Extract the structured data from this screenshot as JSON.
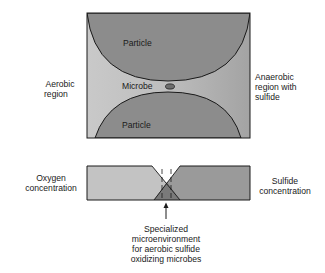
{
  "diagram": {
    "top_panel": {
      "particle_top_label": "Particle",
      "particle_bottom_label": "Particle",
      "microbe_label": "Microbe",
      "left_label_line1": "Aerobic",
      "left_label_line2": "region",
      "right_label_line1": "Anaerobic",
      "right_label_line2": "region with",
      "right_label_line3": "sulfide"
    },
    "bottom_panel": {
      "left_label_line1": "Oxygen",
      "left_label_line2": "concentration",
      "right_label_line1": "Sulfide",
      "right_label_line2": "concentration",
      "caption_line1": "Specialized",
      "caption_line2": "microenvironment",
      "caption_line3": "for aerobic sulfide",
      "caption_line4": "oxidizing microbes"
    },
    "colors": {
      "particle": "#8c8c8c",
      "aerobic_fill": "#c6c6c6",
      "anaerobic_fill": "#a2a2a2",
      "oxygen_fill": "#c3c3c3",
      "sulfide_fill": "#9a9a9a",
      "overlap_fill": "#7a7a7a",
      "outline": "#1a1a1a"
    }
  }
}
